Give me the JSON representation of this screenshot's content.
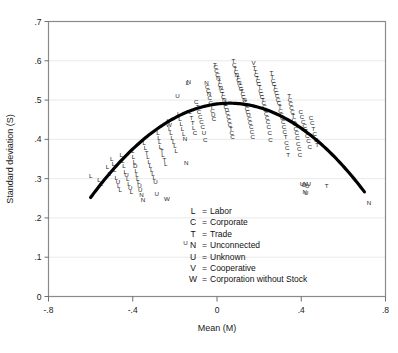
{
  "chart_data": {
    "type": "scatter",
    "title": "",
    "xlabel": "Mean (M)",
    "ylabel": "Standard deviation (S)",
    "xlim": [
      -0.8,
      0.8
    ],
    "ylim": [
      0.0,
      0.7
    ],
    "xticks": [
      "-.8",
      "-.4",
      "0",
      ".4",
      ".8"
    ],
    "xtick_values": [
      -0.8,
      -0.4,
      0,
      0.4,
      0.8
    ],
    "yticks": [
      "0",
      ".1",
      ".2",
      ".3",
      ".4",
      ".5",
      ".6",
      ".7"
    ],
    "ytick_values": [
      0,
      0.1,
      0.2,
      0.3,
      0.4,
      0.5,
      0.6,
      0.7
    ],
    "grid": "horizontal",
    "legend_position": "inside-bottom-center",
    "marker_style": "letter-codes",
    "legend": [
      {
        "key": "L",
        "sep": "=",
        "label": "Labor"
      },
      {
        "key": "C",
        "sep": "=",
        "label": "Corporate"
      },
      {
        "key": "T",
        "sep": "=",
        "label": "Trade"
      },
      {
        "key": "N",
        "sep": "=",
        "label": "Unconnected"
      },
      {
        "key": "U",
        "sep": "=",
        "label": "Unknown"
      },
      {
        "key": "V",
        "sep": "=",
        "label": "Cooperative"
      },
      {
        "key": "W",
        "sep": "=",
        "label": "Corporation without Stock"
      }
    ],
    "fit_curve": {
      "type": "quadratic",
      "description": "inverted parabola fit of S on M",
      "color": "#000000",
      "linewidth": 3.2,
      "x_start": -0.6,
      "x_end": 0.7,
      "vertex_x": 0.06,
      "vertex_y": 0.492,
      "y_at_x_start": 0.252,
      "y_at_x_end": 0.188,
      "a": -0.566
    },
    "points": [
      {
        "x": -0.6,
        "y": 0.307,
        "m": "L"
      },
      {
        "x": -0.56,
        "y": 0.298,
        "m": "L"
      },
      {
        "x": -0.548,
        "y": 0.288,
        "m": "L"
      },
      {
        "x": -0.52,
        "y": 0.33,
        "m": "L"
      },
      {
        "x": -0.512,
        "y": 0.313,
        "m": "L"
      },
      {
        "x": -0.5,
        "y": 0.352,
        "m": "L"
      },
      {
        "x": -0.492,
        "y": 0.338,
        "m": "L"
      },
      {
        "x": -0.486,
        "y": 0.322,
        "m": "L"
      },
      {
        "x": -0.478,
        "y": 0.303,
        "m": "L"
      },
      {
        "x": -0.47,
        "y": 0.292,
        "m": "U"
      },
      {
        "x": -0.466,
        "y": 0.281,
        "m": "L"
      },
      {
        "x": -0.46,
        "y": 0.272,
        "m": "L"
      },
      {
        "x": -0.455,
        "y": 0.36,
        "m": "L"
      },
      {
        "x": -0.448,
        "y": 0.345,
        "m": "L"
      },
      {
        "x": -0.442,
        "y": 0.333,
        "m": "L"
      },
      {
        "x": -0.436,
        "y": 0.318,
        "m": "L"
      },
      {
        "x": -0.43,
        "y": 0.309,
        "m": "U"
      },
      {
        "x": -0.424,
        "y": 0.299,
        "m": "L"
      },
      {
        "x": -0.418,
        "y": 0.288,
        "m": "L"
      },
      {
        "x": -0.412,
        "y": 0.277,
        "m": "U"
      },
      {
        "x": -0.406,
        "y": 0.268,
        "m": "L"
      },
      {
        "x": -0.4,
        "y": 0.372,
        "m": "L"
      },
      {
        "x": -0.396,
        "y": 0.356,
        "m": "L"
      },
      {
        "x": -0.392,
        "y": 0.344,
        "m": "L"
      },
      {
        "x": -0.388,
        "y": 0.332,
        "m": "D"
      },
      {
        "x": -0.384,
        "y": 0.32,
        "m": "L"
      },
      {
        "x": -0.38,
        "y": 0.31,
        "m": "L"
      },
      {
        "x": -0.376,
        "y": 0.3,
        "m": "L"
      },
      {
        "x": -0.372,
        "y": 0.291,
        "m": "L"
      },
      {
        "x": -0.368,
        "y": 0.282,
        "m": "U"
      },
      {
        "x": -0.364,
        "y": 0.273,
        "m": "U"
      },
      {
        "x": -0.358,
        "y": 0.258,
        "m": "N"
      },
      {
        "x": -0.352,
        "y": 0.247,
        "m": "N"
      },
      {
        "x": -0.345,
        "y": 0.392,
        "m": "L"
      },
      {
        "x": -0.34,
        "y": 0.378,
        "m": "L"
      },
      {
        "x": -0.334,
        "y": 0.366,
        "m": "T"
      },
      {
        "x": -0.328,
        "y": 0.355,
        "m": "L"
      },
      {
        "x": -0.322,
        "y": 0.344,
        "m": "L"
      },
      {
        "x": -0.316,
        "y": 0.334,
        "m": "L"
      },
      {
        "x": -0.31,
        "y": 0.322,
        "m": "L"
      },
      {
        "x": -0.304,
        "y": 0.312,
        "m": "L"
      },
      {
        "x": -0.298,
        "y": 0.302,
        "m": "L"
      },
      {
        "x": -0.292,
        "y": 0.292,
        "m": "U"
      },
      {
        "x": -0.286,
        "y": 0.262,
        "m": "U"
      },
      {
        "x": -0.28,
        "y": 0.418,
        "m": "L"
      },
      {
        "x": -0.276,
        "y": 0.404,
        "m": "L"
      },
      {
        "x": -0.272,
        "y": 0.394,
        "m": "L"
      },
      {
        "x": -0.268,
        "y": 0.382,
        "m": "L"
      },
      {
        "x": -0.262,
        "y": 0.372,
        "m": "T"
      },
      {
        "x": -0.256,
        "y": 0.36,
        "m": "L"
      },
      {
        "x": -0.25,
        "y": 0.348,
        "m": "T"
      },
      {
        "x": -0.244,
        "y": 0.338,
        "m": "L"
      },
      {
        "x": -0.238,
        "y": 0.248,
        "m": "W"
      },
      {
        "x": -0.232,
        "y": 0.448,
        "m": "L"
      },
      {
        "x": -0.228,
        "y": 0.438,
        "m": "W"
      },
      {
        "x": -0.224,
        "y": 0.427,
        "m": "L"
      },
      {
        "x": -0.218,
        "y": 0.416,
        "m": "L"
      },
      {
        "x": -0.212,
        "y": 0.405,
        "m": "L"
      },
      {
        "x": -0.206,
        "y": 0.394,
        "m": "L"
      },
      {
        "x": -0.2,
        "y": 0.383,
        "m": "L"
      },
      {
        "x": -0.194,
        "y": 0.372,
        "m": "L"
      },
      {
        "x": -0.188,
        "y": 0.512,
        "m": "U"
      },
      {
        "x": -0.182,
        "y": 0.465,
        "m": "L"
      },
      {
        "x": -0.176,
        "y": 0.452,
        "m": "L"
      },
      {
        "x": -0.17,
        "y": 0.44,
        "m": "L"
      },
      {
        "x": -0.164,
        "y": 0.428,
        "m": "L"
      },
      {
        "x": -0.158,
        "y": 0.415,
        "m": "L"
      },
      {
        "x": -0.152,
        "y": 0.402,
        "m": "N"
      },
      {
        "x": -0.146,
        "y": 0.34,
        "m": "N"
      },
      {
        "x": -0.15,
        "y": 0.138,
        "m": "U"
      },
      {
        "x": -0.14,
        "y": 0.545,
        "m": "L"
      },
      {
        "x": -0.134,
        "y": 0.548,
        "m": "N"
      },
      {
        "x": -0.128,
        "y": 0.47,
        "m": "L"
      },
      {
        "x": -0.122,
        "y": 0.455,
        "m": "T"
      },
      {
        "x": -0.116,
        "y": 0.442,
        "m": "T"
      },
      {
        "x": -0.11,
        "y": 0.43,
        "m": "L"
      },
      {
        "x": -0.104,
        "y": 0.418,
        "m": "C"
      },
      {
        "x": -0.098,
        "y": 0.496,
        "m": "C"
      },
      {
        "x": -0.092,
        "y": 0.482,
        "m": "T"
      },
      {
        "x": -0.086,
        "y": 0.47,
        "m": "C"
      },
      {
        "x": -0.08,
        "y": 0.458,
        "m": "C"
      },
      {
        "x": -0.074,
        "y": 0.445,
        "m": "C"
      },
      {
        "x": -0.068,
        "y": 0.432,
        "m": "C"
      },
      {
        "x": -0.062,
        "y": 0.418,
        "m": "U"
      },
      {
        "x": -0.056,
        "y": 0.398,
        "m": "C"
      },
      {
        "x": -0.05,
        "y": 0.545,
        "m": "N"
      },
      {
        "x": -0.046,
        "y": 0.535,
        "m": "C"
      },
      {
        "x": -0.042,
        "y": 0.525,
        "m": "C"
      },
      {
        "x": -0.038,
        "y": 0.515,
        "m": "N"
      },
      {
        "x": -0.034,
        "y": 0.505,
        "m": "C"
      },
      {
        "x": -0.03,
        "y": 0.494,
        "m": "C"
      },
      {
        "x": -0.026,
        "y": 0.484,
        "m": "T"
      },
      {
        "x": -0.022,
        "y": 0.472,
        "m": "C"
      },
      {
        "x": -0.018,
        "y": 0.462,
        "m": "U"
      },
      {
        "x": -0.014,
        "y": 0.452,
        "m": "C"
      },
      {
        "x": -0.01,
        "y": 0.59,
        "m": "T"
      },
      {
        "x": -0.006,
        "y": 0.585,
        "m": "C"
      },
      {
        "x": -0.002,
        "y": 0.575,
        "m": "C"
      },
      {
        "x": 0.002,
        "y": 0.565,
        "m": "C"
      },
      {
        "x": 0.006,
        "y": 0.557,
        "m": "N"
      },
      {
        "x": 0.01,
        "y": 0.548,
        "m": "T"
      },
      {
        "x": 0.014,
        "y": 0.54,
        "m": "C"
      },
      {
        "x": 0.018,
        "y": 0.532,
        "m": "N"
      },
      {
        "x": 0.022,
        "y": 0.524,
        "m": "C"
      },
      {
        "x": 0.026,
        "y": 0.516,
        "m": "T"
      },
      {
        "x": 0.03,
        "y": 0.508,
        "m": "C"
      },
      {
        "x": 0.034,
        "y": 0.5,
        "m": "N"
      },
      {
        "x": 0.038,
        "y": 0.492,
        "m": "C"
      },
      {
        "x": 0.042,
        "y": 0.484,
        "m": "C"
      },
      {
        "x": 0.046,
        "y": 0.476,
        "m": "U"
      },
      {
        "x": 0.05,
        "y": 0.468,
        "m": "C"
      },
      {
        "x": 0.054,
        "y": 0.458,
        "m": "C"
      },
      {
        "x": 0.058,
        "y": 0.448,
        "m": "C"
      },
      {
        "x": 0.062,
        "y": 0.438,
        "m": "C"
      },
      {
        "x": 0.066,
        "y": 0.428,
        "m": "T"
      },
      {
        "x": 0.07,
        "y": 0.418,
        "m": "C"
      },
      {
        "x": 0.074,
        "y": 0.406,
        "m": "C"
      },
      {
        "x": 0.078,
        "y": 0.6,
        "m": "T"
      },
      {
        "x": 0.082,
        "y": 0.59,
        "m": "C"
      },
      {
        "x": 0.086,
        "y": 0.58,
        "m": "T"
      },
      {
        "x": 0.09,
        "y": 0.572,
        "m": "C"
      },
      {
        "x": 0.094,
        "y": 0.565,
        "m": "N"
      },
      {
        "x": 0.098,
        "y": 0.558,
        "m": "T"
      },
      {
        "x": 0.102,
        "y": 0.551,
        "m": "C"
      },
      {
        "x": 0.106,
        "y": 0.544,
        "m": "N"
      },
      {
        "x": 0.11,
        "y": 0.537,
        "m": "C"
      },
      {
        "x": 0.114,
        "y": 0.53,
        "m": "C"
      },
      {
        "x": 0.118,
        "y": 0.523,
        "m": "T"
      },
      {
        "x": 0.122,
        "y": 0.516,
        "m": "C"
      },
      {
        "x": 0.126,
        "y": 0.509,
        "m": "C"
      },
      {
        "x": 0.13,
        "y": 0.502,
        "m": "N"
      },
      {
        "x": 0.134,
        "y": 0.495,
        "m": "C"
      },
      {
        "x": 0.138,
        "y": 0.487,
        "m": "C"
      },
      {
        "x": 0.142,
        "y": 0.479,
        "m": "C"
      },
      {
        "x": 0.146,
        "y": 0.47,
        "m": "C"
      },
      {
        "x": 0.15,
        "y": 0.462,
        "m": "U"
      },
      {
        "x": 0.154,
        "y": 0.452,
        "m": "C"
      },
      {
        "x": 0.158,
        "y": 0.442,
        "m": "C"
      },
      {
        "x": 0.162,
        "y": 0.432,
        "m": "C"
      },
      {
        "x": 0.166,
        "y": 0.42,
        "m": "C"
      },
      {
        "x": 0.17,
        "y": 0.406,
        "m": "C"
      },
      {
        "x": 0.174,
        "y": 0.596,
        "m": "V"
      },
      {
        "x": 0.178,
        "y": 0.582,
        "m": "T"
      },
      {
        "x": 0.182,
        "y": 0.573,
        "m": "T"
      },
      {
        "x": 0.186,
        "y": 0.565,
        "m": "C"
      },
      {
        "x": 0.19,
        "y": 0.557,
        "m": "T"
      },
      {
        "x": 0.194,
        "y": 0.549,
        "m": "C"
      },
      {
        "x": 0.198,
        "y": 0.541,
        "m": "C"
      },
      {
        "x": 0.202,
        "y": 0.533,
        "m": "T"
      },
      {
        "x": 0.206,
        "y": 0.525,
        "m": "C"
      },
      {
        "x": 0.21,
        "y": 0.517,
        "m": "C"
      },
      {
        "x": 0.214,
        "y": 0.509,
        "m": "C"
      },
      {
        "x": 0.218,
        "y": 0.501,
        "m": "T"
      },
      {
        "x": 0.222,
        "y": 0.493,
        "m": "C"
      },
      {
        "x": 0.226,
        "y": 0.484,
        "m": "C"
      },
      {
        "x": 0.23,
        "y": 0.475,
        "m": "C"
      },
      {
        "x": 0.234,
        "y": 0.466,
        "m": "C"
      },
      {
        "x": 0.238,
        "y": 0.456,
        "m": "C"
      },
      {
        "x": 0.242,
        "y": 0.444,
        "m": "C"
      },
      {
        "x": 0.246,
        "y": 0.432,
        "m": "C"
      },
      {
        "x": 0.25,
        "y": 0.418,
        "m": "C"
      },
      {
        "x": 0.254,
        "y": 0.4,
        "m": "C"
      },
      {
        "x": 0.258,
        "y": 0.57,
        "m": "T"
      },
      {
        "x": 0.262,
        "y": 0.56,
        "m": "T"
      },
      {
        "x": 0.266,
        "y": 0.55,
        "m": "C"
      },
      {
        "x": 0.27,
        "y": 0.542,
        "m": "C"
      },
      {
        "x": 0.274,
        "y": 0.534,
        "m": "T"
      },
      {
        "x": 0.278,
        "y": 0.526,
        "m": "C"
      },
      {
        "x": 0.282,
        "y": 0.518,
        "m": "C"
      },
      {
        "x": 0.286,
        "y": 0.51,
        "m": "C"
      },
      {
        "x": 0.29,
        "y": 0.502,
        "m": "C"
      },
      {
        "x": 0.294,
        "y": 0.493,
        "m": "C"
      },
      {
        "x": 0.298,
        "y": 0.484,
        "m": "T"
      },
      {
        "x": 0.302,
        "y": 0.474,
        "m": "C"
      },
      {
        "x": 0.306,
        "y": 0.464,
        "m": "C"
      },
      {
        "x": 0.31,
        "y": 0.454,
        "m": "C"
      },
      {
        "x": 0.314,
        "y": 0.444,
        "m": "C"
      },
      {
        "x": 0.318,
        "y": 0.432,
        "m": "C"
      },
      {
        "x": 0.322,
        "y": 0.42,
        "m": "C"
      },
      {
        "x": 0.326,
        "y": 0.406,
        "m": "T"
      },
      {
        "x": 0.33,
        "y": 0.392,
        "m": "C"
      },
      {
        "x": 0.334,
        "y": 0.378,
        "m": "C"
      },
      {
        "x": 0.338,
        "y": 0.362,
        "m": "T"
      },
      {
        "x": 0.342,
        "y": 0.51,
        "m": "T"
      },
      {
        "x": 0.346,
        "y": 0.5,
        "m": "C"
      },
      {
        "x": 0.35,
        "y": 0.49,
        "m": "C"
      },
      {
        "x": 0.354,
        "y": 0.48,
        "m": "C"
      },
      {
        "x": 0.358,
        "y": 0.47,
        "m": "C"
      },
      {
        "x": 0.362,
        "y": 0.46,
        "m": "T"
      },
      {
        "x": 0.366,
        "y": 0.45,
        "m": "C"
      },
      {
        "x": 0.37,
        "y": 0.44,
        "m": "C"
      },
      {
        "x": 0.374,
        "y": 0.428,
        "m": "C"
      },
      {
        "x": 0.378,
        "y": 0.416,
        "m": "C"
      },
      {
        "x": 0.382,
        "y": 0.404,
        "m": "C"
      },
      {
        "x": 0.386,
        "y": 0.39,
        "m": "C"
      },
      {
        "x": 0.39,
        "y": 0.376,
        "m": "C"
      },
      {
        "x": 0.394,
        "y": 0.362,
        "m": "C"
      },
      {
        "x": 0.398,
        "y": 0.47,
        "m": "C"
      },
      {
        "x": 0.404,
        "y": 0.458,
        "m": "C"
      },
      {
        "x": 0.41,
        "y": 0.446,
        "m": "C"
      },
      {
        "x": 0.416,
        "y": 0.434,
        "m": "C"
      },
      {
        "x": 0.422,
        "y": 0.422,
        "m": "T"
      },
      {
        "x": 0.428,
        "y": 0.41,
        "m": "C"
      },
      {
        "x": 0.434,
        "y": 0.396,
        "m": "C"
      },
      {
        "x": 0.44,
        "y": 0.382,
        "m": "C"
      },
      {
        "x": 0.446,
        "y": 0.456,
        "m": "C"
      },
      {
        "x": 0.452,
        "y": 0.442,
        "m": "C"
      },
      {
        "x": 0.458,
        "y": 0.428,
        "m": "T"
      },
      {
        "x": 0.464,
        "y": 0.414,
        "m": "C"
      },
      {
        "x": 0.47,
        "y": 0.398,
        "m": "C"
      },
      {
        "x": 0.476,
        "y": 0.386,
        "m": "T"
      },
      {
        "x": 0.404,
        "y": 0.288,
        "m": "U"
      },
      {
        "x": 0.412,
        "y": 0.284,
        "m": "U"
      },
      {
        "x": 0.42,
        "y": 0.286,
        "m": "N"
      },
      {
        "x": 0.428,
        "y": 0.282,
        "m": "U"
      },
      {
        "x": 0.436,
        "y": 0.288,
        "m": "U"
      },
      {
        "x": 0.416,
        "y": 0.268,
        "m": "N"
      },
      {
        "x": 0.424,
        "y": 0.264,
        "m": "U"
      },
      {
        "x": 0.52,
        "y": 0.282,
        "m": "T"
      },
      {
        "x": 0.722,
        "y": 0.24,
        "m": "N"
      }
    ]
  }
}
